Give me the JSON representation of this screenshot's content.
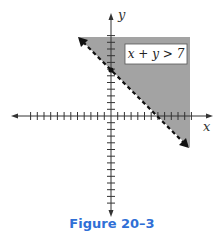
{
  "chart_data": {
    "type": "area",
    "title": "",
    "caption": "Figure 20–3",
    "xlabel": "x",
    "ylabel": "y",
    "inequality": "x + y > 7",
    "boundary_line": {
      "equation": "x + y = 7",
      "style": "dashed",
      "x_intercept": 7,
      "y_intercept": 7,
      "points": [
        [
          -5,
          12
        ],
        [
          0,
          7
        ],
        [
          7,
          0
        ],
        [
          11,
          -4
        ]
      ],
      "y_intercept_marked": true
    },
    "shaded_region": "above/right of line (x + y > 7)",
    "xlim": [
      -14,
      14
    ],
    "ylim": [
      -14,
      14
    ],
    "tick_spacing": 1,
    "grid": false,
    "legend": "none",
    "colors": {
      "shade": "#9a9a9a",
      "line": "#1a1a1a",
      "axes": "#333333",
      "caption": "#2f6fd6"
    }
  },
  "labels": {
    "x_axis": "x",
    "y_axis": "y",
    "inequality_box": "x + y > 7",
    "caption": "Figure 20–3"
  }
}
